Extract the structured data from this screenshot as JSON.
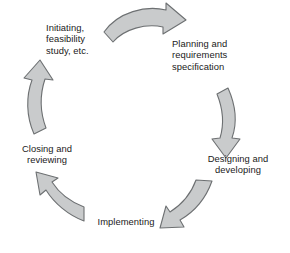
{
  "diagram": {
    "type": "cycle",
    "background_color": "#ffffff",
    "direction": "clockwise",
    "arrow_fill_color": "#c9cbcc",
    "arrow_stroke_color": "#6d7072",
    "text_color": "#1a1a1a",
    "stages": [
      {
        "id": "initiating",
        "label": "Initiating,\nfeasibility\nstudy, etc.",
        "position": "top-left"
      },
      {
        "id": "planning",
        "label": "Planning and\nrequirements\nspecification",
        "position": "top-right"
      },
      {
        "id": "designing",
        "label": "Designing and\ndeveloping",
        "position": "right-bottom"
      },
      {
        "id": "implementing",
        "label": "Implementing",
        "position": "bottom"
      },
      {
        "id": "closing",
        "label": "Closing and\nreviewing",
        "position": "left"
      }
    ],
    "arrows": [
      {
        "id": "arrow-initiating-to-planning",
        "name": "curved-arrow-top",
        "from": "initiating",
        "to": "planning"
      },
      {
        "id": "arrow-planning-to-designing",
        "name": "curved-arrow-right",
        "from": "planning",
        "to": "designing"
      },
      {
        "id": "arrow-designing-to-implementing",
        "name": "curved-arrow-bottom-right",
        "from": "designing",
        "to": "implementing"
      },
      {
        "id": "arrow-implementing-to-closing",
        "name": "curved-arrow-bottom-left",
        "from": "implementing",
        "to": "closing"
      },
      {
        "id": "arrow-closing-to-initiating",
        "name": "curved-arrow-left",
        "from": "closing",
        "to": "initiating"
      }
    ]
  }
}
